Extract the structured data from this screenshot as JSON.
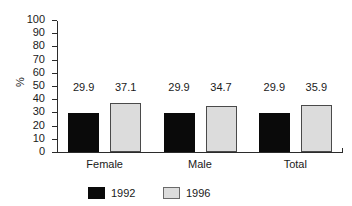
{
  "chart_data": {
    "type": "bar",
    "title": "",
    "subtitle": "",
    "xlabel": "",
    "ylabel": "%",
    "categories": [
      "Female",
      "Male",
      "Total"
    ],
    "series": [
      {
        "name": "1992",
        "color": "#0a0a0a",
        "values": [
          29.9,
          29.9,
          29.9
        ]
      },
      {
        "name": "1996",
        "color": "#dcdcdc",
        "values": [
          37.1,
          34.7,
          35.9
        ]
      }
    ],
    "data_labels": [
      [
        "29.9",
        "37.1"
      ],
      [
        "29.9",
        "34.7"
      ],
      [
        "29.9",
        "35.9"
      ]
    ],
    "ylim": [
      0,
      100
    ],
    "ytick_values": [
      0,
      10,
      20,
      30,
      40,
      50,
      60,
      70,
      80,
      90,
      100
    ],
    "ytick_labels": [
      "0",
      "10",
      "20",
      "30",
      "40",
      "50",
      "60",
      "70",
      "80",
      "90",
      "100"
    ],
    "grid": false,
    "legend_position": "bottom-center",
    "legend_entries": [
      "1992",
      "1996"
    ]
  }
}
